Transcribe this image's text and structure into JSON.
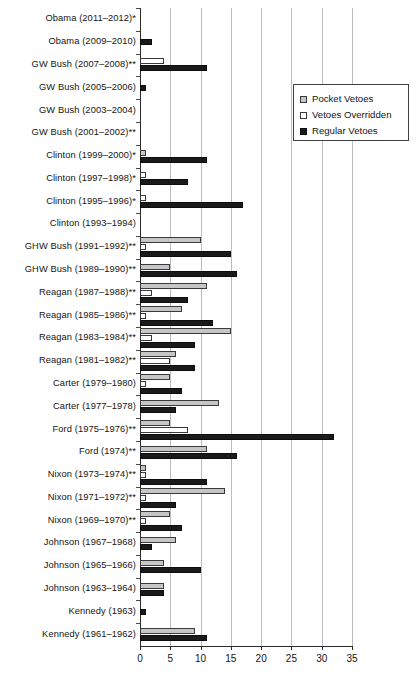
{
  "chart_data": {
    "type": "bar",
    "orientation": "horizontal",
    "title": "",
    "xlabel": "",
    "ylabel": "",
    "xlim": [
      0,
      35
    ],
    "xticks": [
      0,
      5,
      10,
      15,
      20,
      25,
      30,
      35
    ],
    "grid": true,
    "legend_position": "top-right",
    "legend": [
      "Pocket Vetoes",
      "Vetoes Overridden",
      "Regular Vetoes"
    ],
    "series_colors": {
      "Pocket Vetoes": "#c6c6c6",
      "Vetoes Overridden": "#ffffff",
      "Regular Vetoes": "#1a1a1a"
    },
    "categories": [
      "Obama (2011–2012)*",
      "Obama (2009–2010)",
      "GW Bush (2007–2008)**",
      "GW Bush (2005–2006)",
      "GW Bush (2003–2004)",
      "GW Bush (2001–2002)**",
      "Clinton (1999–2000)*",
      "Clinton (1997–1998)*",
      "Clinton (1995–1996)*",
      "Clinton (1993–1994)",
      "GHW Bush (1991–1992)**",
      "GHW Bush (1989–1990)**",
      "Reagan (1987–1988)**",
      "Reagan (1985–1986)**",
      "Reagan (1983–1984)**",
      "Reagan (1981–1982)**",
      "Carter (1979–1980)",
      "Carter (1977–1978)",
      "Ford (1975–1976)**",
      "Ford (1974)**",
      "Nixon (1973–1974)**",
      "Nixon (1971–1972)**",
      "Nixon (1969–1970)**",
      "Johnson (1967–1968)",
      "Johnson (1965–1966)",
      "Johnson (1963–1964)",
      "Kennedy (1963)",
      "Kennedy (1961–1962)"
    ],
    "series": [
      {
        "name": "Pocket Vetoes",
        "values": [
          0,
          0,
          0,
          0,
          0,
          0,
          1,
          0,
          0,
          0,
          10,
          5,
          11,
          7,
          15,
          6,
          5,
          13,
          5,
          11,
          1,
          14,
          5,
          6,
          4,
          4,
          0,
          9
        ]
      },
      {
        "name": "Vetoes Overridden",
        "values": [
          0,
          0,
          4,
          0,
          0,
          0,
          0,
          1,
          1,
          0,
          1,
          0,
          2,
          1,
          2,
          5,
          1,
          0,
          8,
          0,
          1,
          1,
          1,
          0,
          0,
          0,
          0,
          0
        ]
      },
      {
        "name": "Regular Vetoes",
        "values": [
          0,
          2,
          11,
          1,
          0,
          0,
          11,
          8,
          17,
          0,
          15,
          16,
          8,
          12,
          9,
          9,
          7,
          6,
          32,
          16,
          11,
          6,
          7,
          2,
          10,
          4,
          1,
          11
        ]
      }
    ]
  }
}
